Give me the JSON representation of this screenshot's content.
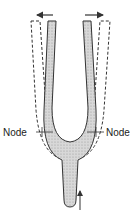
{
  "diagram": {
    "labels": {
      "node_left": "Node",
      "node_right": "Node"
    },
    "arrows": {
      "left_tine_motion": "outward-left",
      "right_tine_motion": "outward-right",
      "stem_motion": "vertical"
    },
    "colors": {
      "stroke": "#333333",
      "fill": "#cfcfcf",
      "background": "#ffffff"
    }
  }
}
